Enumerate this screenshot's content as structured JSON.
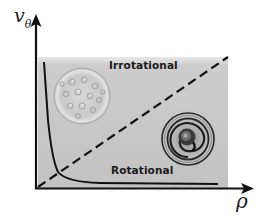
{
  "diagram": {
    "type": "conceptual-regime-plot",
    "axes": {
      "y_label": "v",
      "y_label_subscript": "θ",
      "x_label": "ρ"
    },
    "regions": {
      "upper_label": "Irrotational",
      "lower_label": "Rotational"
    },
    "elements": {
      "boundary_line": "dashed diagonal",
      "curve": "decaying curve (hyperbola-like) from top-left to bottom-right",
      "upper_image": "petri-dish with droplets",
      "lower_image": "spiral vortex"
    },
    "colors": {
      "panel_fill": "#c4c4c4",
      "panel_top_highlight": "#e6e6e6",
      "axis": "#111111",
      "curve": "#111111",
      "dashed_line": "#111111",
      "text": "#1a1a1a"
    }
  }
}
